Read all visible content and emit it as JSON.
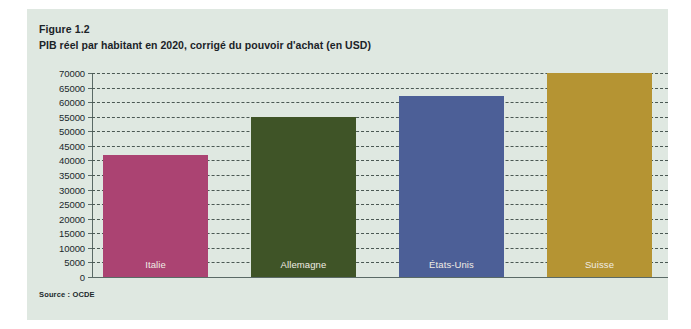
{
  "figure": {
    "number": "Figure 1.2",
    "title": "PIB réel par habitant en 2020, corrigé du pouvoir d'achat (en USD)",
    "source": "Source : OCDE"
  },
  "colors": {
    "card_background": "#dfe8e1",
    "page_background": "#ffffff",
    "axis": "#5a6a66",
    "gridline": "#4a5853",
    "text": "#20282c",
    "bar_label": "#f0ece4"
  },
  "chart_data": {
    "type": "bar",
    "title": "PIB réel par habitant en 2020, corrigé du pouvoir d'achat (en USD)",
    "xlabel": "",
    "ylabel": "",
    "ylim": [
      0,
      70000
    ],
    "grid": true,
    "legend": "none",
    "categories": [
      "Italie",
      "Allemagne",
      "États-Unis",
      "Suisse"
    ],
    "values": [
      42000,
      55000,
      62000,
      70000
    ],
    "colors": [
      "#ab4372",
      "#3f5427",
      "#4c5f97",
      "#b59433"
    ],
    "ticks": [
      "0",
      "5000",
      "10000",
      "15000",
      "20000",
      "25000",
      "30000",
      "35000",
      "40000",
      "45000",
      "50000",
      "55000",
      "60000",
      "65000",
      "70000"
    ],
    "tick_values": [
      0,
      5000,
      10000,
      15000,
      20000,
      25000,
      30000,
      35000,
      40000,
      45000,
      50000,
      55000,
      60000,
      65000,
      70000
    ],
    "bars": [
      {
        "label": "Italie",
        "value": 42000,
        "color": "#ab4372"
      },
      {
        "label": "Allemagne",
        "value": 55000,
        "color": "#3f5427"
      },
      {
        "label": "États-Unis",
        "value": 62000,
        "color": "#4c5f97"
      },
      {
        "label": "Suisse",
        "value": 70000,
        "color": "#b59433"
      }
    ]
  }
}
